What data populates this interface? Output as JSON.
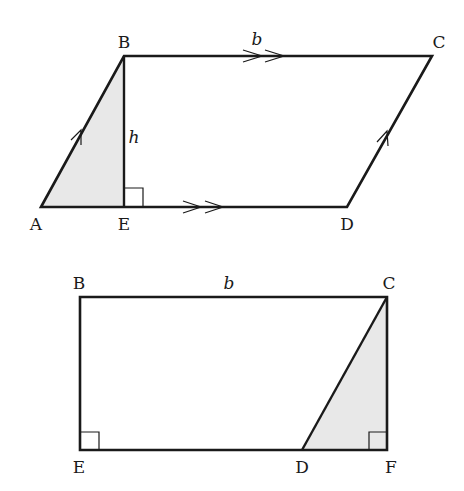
{
  "figure_top": {
    "title": "Parallelogram ABCD with height h",
    "labels": {
      "A": "A",
      "B": "B",
      "C": "C",
      "D": "D",
      "E": "E",
      "base": "b",
      "height": "h"
    },
    "shade_color": "#e8e8e8",
    "line_color": "#1a1a1a"
  },
  "figure_bottom": {
    "title": "Rectangle EBCF formed by moving triangle",
    "labels": {
      "B": "B",
      "C": "C",
      "D": "D",
      "E": "E",
      "F": "F",
      "base": "b"
    },
    "shade_color": "#e8e8e8",
    "line_color": "#1a1a1a"
  }
}
